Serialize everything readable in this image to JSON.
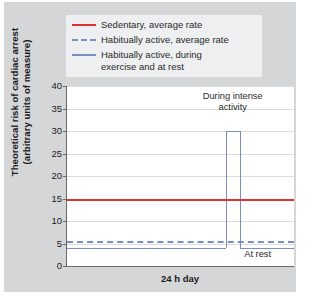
{
  "chart_data": {
    "type": "line",
    "title": "",
    "xlabel": "24 h day",
    "ylabel": "Theoretical risk of cardiac arrest\n(arbitrary units of measure)",
    "ylim": [
      0,
      40
    ],
    "yticks": [
      0,
      5,
      10,
      15,
      20,
      25,
      30,
      35,
      40
    ],
    "ytick_labels": [
      "0",
      "5",
      "10",
      "15",
      "20",
      "25",
      "30",
      "35",
      "40"
    ],
    "xlim": [
      0,
      100
    ],
    "xticks": [],
    "xtick_labels": [],
    "grid": true,
    "legend_position": "above-plot",
    "series": [
      {
        "name": "Sedentary, average rate",
        "style": "solid",
        "color": "#e0322f",
        "kind": "constant",
        "value": 15,
        "x": [
          0,
          100
        ],
        "values": [
          15,
          15
        ]
      },
      {
        "name": "Habitually active, average rate",
        "style": "dashed",
        "color": "#7a8fc0",
        "kind": "constant",
        "value": 5.5,
        "x": [
          0,
          100
        ],
        "values": [
          5.5,
          5.5
        ]
      },
      {
        "name": "Habitually active, during\nexercise and at rest",
        "style": "solid",
        "color": "#7a8fc0",
        "kind": "step",
        "x": [
          0,
          70,
          70,
          76,
          76,
          100
        ],
        "values": [
          4,
          4,
          30,
          30,
          4,
          4
        ],
        "baseline": 4,
        "peak": 30,
        "peak_start_x": 70,
        "peak_end_x": 76
      }
    ],
    "annotations": [
      {
        "text": "During intense\nactivity",
        "x": 73,
        "y": 37.5
      },
      {
        "text": "At rest",
        "x": 84,
        "y": 2.5
      }
    ],
    "colors": {
      "sedentary": "#e0322f",
      "active": "#7a8fc0",
      "grid": "#dcdcdc",
      "axis": "#6a6a6a",
      "panel_background": "#d5d6d8",
      "plot_background": "#ffffff",
      "legend_background": "#eeeff1"
    }
  }
}
